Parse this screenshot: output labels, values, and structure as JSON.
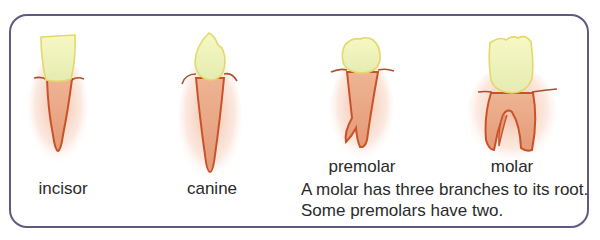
{
  "diagram": {
    "title": "",
    "teeth": [
      {
        "id": "incisor",
        "label": "incisor"
      },
      {
        "id": "canine",
        "label": "canine"
      },
      {
        "id": "premolar",
        "label": "premolar"
      },
      {
        "id": "molar",
        "label": "molar"
      }
    ],
    "caption": "A molar has three branches to its root. Some premolars have two.",
    "colors": {
      "border": "#5f5a80",
      "crown_fill": "#eef3b8",
      "crown_stroke": "#e3d86a",
      "root_fill": "#e9a88a",
      "root_stroke": "#c9522a",
      "gum_line": "#b05a38"
    }
  }
}
